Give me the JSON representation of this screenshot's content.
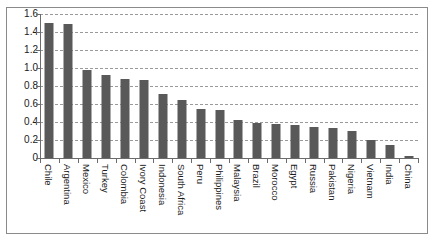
{
  "chart_data": {
    "type": "bar",
    "title": "",
    "subtitle": "",
    "xlabel": "",
    "ylabel": "",
    "ylim": [
      0,
      1.6
    ],
    "ytick_labels": [
      "1.6",
      "1.4",
      "1.2",
      "1.0",
      "0.8",
      "0.6",
      "0.4",
      "0.2",
      "0"
    ],
    "ytick_values": [
      1.6,
      1.4,
      1.2,
      1.0,
      0.8,
      0.6,
      0.4,
      0.2,
      0
    ],
    "grid": "horizontal-dashed",
    "legend": "none",
    "bar_color": "#595959",
    "axis_color": "#6b6b6b",
    "grid_color": "#9a9a9a",
    "frame_color": "#8a8a8a",
    "categories": [
      "Chile",
      "Argentina",
      "Mexico",
      "Turkey",
      "Colombia",
      "Ivory Coast",
      "Indonesia",
      "South Africa",
      "Peru",
      "Philippines",
      "Malaysia",
      "Brazil",
      "Morocco",
      "Egypt",
      "Russia",
      "Pakistan",
      "Nigeria",
      "Vietnam",
      "India",
      "China"
    ],
    "values": [
      1.5,
      1.49,
      0.98,
      0.92,
      0.88,
      0.87,
      0.71,
      0.65,
      0.55,
      0.53,
      0.42,
      0.39,
      0.38,
      0.37,
      0.34,
      0.33,
      0.3,
      0.2,
      0.14,
      0.02
    ]
  }
}
